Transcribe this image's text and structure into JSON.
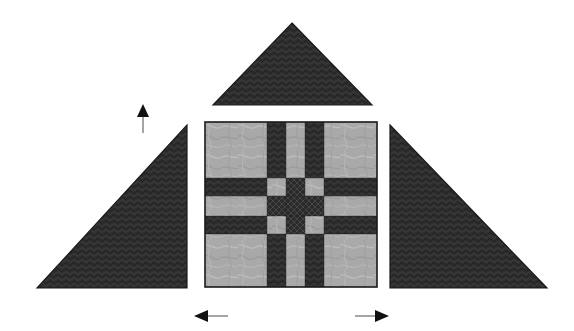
{
  "figure": {
    "canvas": {
      "width": 574,
      "height": 331,
      "background": "#ffffff"
    }
  },
  "palette": {
    "dark_fabric": "#2e2e2e",
    "dark_fabric_alt": "#262626",
    "light_fabric": "#a8a8a8",
    "light_fabric_alt": "#b4b4b4",
    "outline": "#1a1a1a",
    "arrow": "#111111",
    "arrow_shaft": "#8a8a8a"
  },
  "shapes": {
    "top_triangle": {
      "label": "top-triangle",
      "fabric": "dark_fabric",
      "points": "292,23 372,105 213,105",
      "apex": {
        "x": 292,
        "y": 23
      },
      "base_left": {
        "x": 213,
        "y": 105
      },
      "base_right": {
        "x": 372,
        "y": 105
      }
    },
    "left_triangle": {
      "label": "left-triangle",
      "fabric": "dark_fabric",
      "points": "187,125 187,288 37,288",
      "apex": {
        "x": 187,
        "y": 125
      },
      "corner": {
        "x": 187,
        "y": 288
      },
      "base_left": {
        "x": 37,
        "y": 288
      }
    },
    "right_triangle": {
      "label": "right-triangle",
      "fabric": "dark_fabric",
      "points": "390,125 547,288 390,288",
      "apex": {
        "x": 390,
        "y": 125
      },
      "corner": {
        "x": 390,
        "y": 288
      },
      "base_right": {
        "x": 547,
        "y": 288
      }
    },
    "center_block": {
      "label": "center-square-block",
      "x": 205,
      "y": 122,
      "width": 172,
      "height": 165,
      "grid_columns": 5,
      "grid_rows": 5,
      "column_widths": [
        62,
        19,
        19,
        19,
        53
      ],
      "row_heights": [
        56,
        18,
        20,
        18,
        53
      ],
      "cells": [
        [
          "light",
          "dark",
          "light",
          "dark",
          "light"
        ],
        [
          "dark",
          "light",
          "dark",
          "light",
          "dark"
        ],
        [
          "light",
          "dark",
          "dark",
          "dark",
          "light"
        ],
        [
          "dark",
          "light",
          "dark",
          "light",
          "dark"
        ],
        [
          "light",
          "dark",
          "light",
          "dark",
          "light"
        ]
      ]
    }
  },
  "arrows": {
    "up": {
      "label": "up-arrow",
      "direction": "up",
      "tip": {
        "x": 143,
        "y": 105
      },
      "tail": {
        "x": 143,
        "y": 133
      }
    },
    "left": {
      "label": "left-arrow",
      "direction": "left",
      "tip": {
        "x": 195,
        "y": 316
      },
      "tail": {
        "x": 228,
        "y": 316
      }
    },
    "right": {
      "label": "right-arrow",
      "direction": "right",
      "tip": {
        "x": 388,
        "y": 316
      },
      "tail": {
        "x": 355,
        "y": 316
      }
    }
  }
}
